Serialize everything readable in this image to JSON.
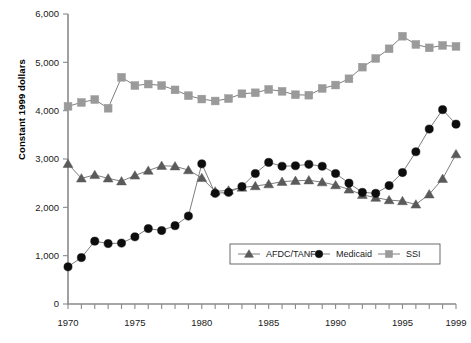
{
  "chart_data": {
    "type": "line",
    "title": "",
    "xlabel": "",
    "ylabel": "Constant 1999 dollars",
    "xlim": [
      1970,
      1999
    ],
    "ylim": [
      0,
      6000
    ],
    "ytick_labels": [
      "0",
      "1,000",
      "2,000",
      "3,000",
      "4,000",
      "5,000",
      "6,000"
    ],
    "ytick_values": [
      0,
      1000,
      2000,
      3000,
      4000,
      5000,
      6000
    ],
    "xtick_labels": [
      "1970",
      "1975",
      "1980",
      "1985",
      "1990",
      "1995",
      "1999"
    ],
    "xtick_values": [
      1970,
      1975,
      1980,
      1985,
      1990,
      1995,
      1999
    ],
    "x_minor_ticks_every": 1,
    "grid": false,
    "legend_position": "inside-lower-right",
    "x": [
      1970,
      1971,
      1972,
      1973,
      1974,
      1975,
      1976,
      1977,
      1978,
      1979,
      1980,
      1981,
      1982,
      1983,
      1984,
      1985,
      1986,
      1987,
      1988,
      1989,
      1990,
      1991,
      1992,
      1993,
      1994,
      1995,
      1996,
      1997,
      1998,
      1999
    ],
    "series": [
      {
        "name": "AFDC/TANF",
        "marker": "triangle",
        "color": "#5a5a5a",
        "values": [
          2900,
          2600,
          2670,
          2600,
          2540,
          2660,
          2760,
          2860,
          2850,
          2770,
          2610,
          2330,
          2350,
          2410,
          2440,
          2480,
          2530,
          2550,
          2560,
          2520,
          2460,
          2370,
          2260,
          2200,
          2150,
          2130,
          2060,
          2270,
          2590,
          3100
        ]
      },
      {
        "name": "Medicaid",
        "marker": "circle",
        "color": "#0d0d0d",
        "values": [
          770,
          960,
          1300,
          1250,
          1260,
          1390,
          1560,
          1520,
          1620,
          1820,
          2900,
          2290,
          2310,
          2430,
          2700,
          2930,
          2850,
          2860,
          2890,
          2850,
          2700,
          2500,
          2310,
          2290,
          2450,
          2720,
          3150,
          3620,
          4020,
          3720
        ]
      },
      {
        "name": "SSI",
        "marker": "square",
        "color": "#9a9a9a",
        "values": [
          4090,
          4170,
          4230,
          4050,
          4690,
          4520,
          4550,
          4520,
          4430,
          4310,
          4240,
          4200,
          4250,
          4350,
          4370,
          4440,
          4400,
          4330,
          4320,
          4460,
          4530,
          4660,
          4900,
          5080,
          5280,
          5540,
          5370,
          5300,
          5350,
          5330
        ]
      }
    ]
  }
}
